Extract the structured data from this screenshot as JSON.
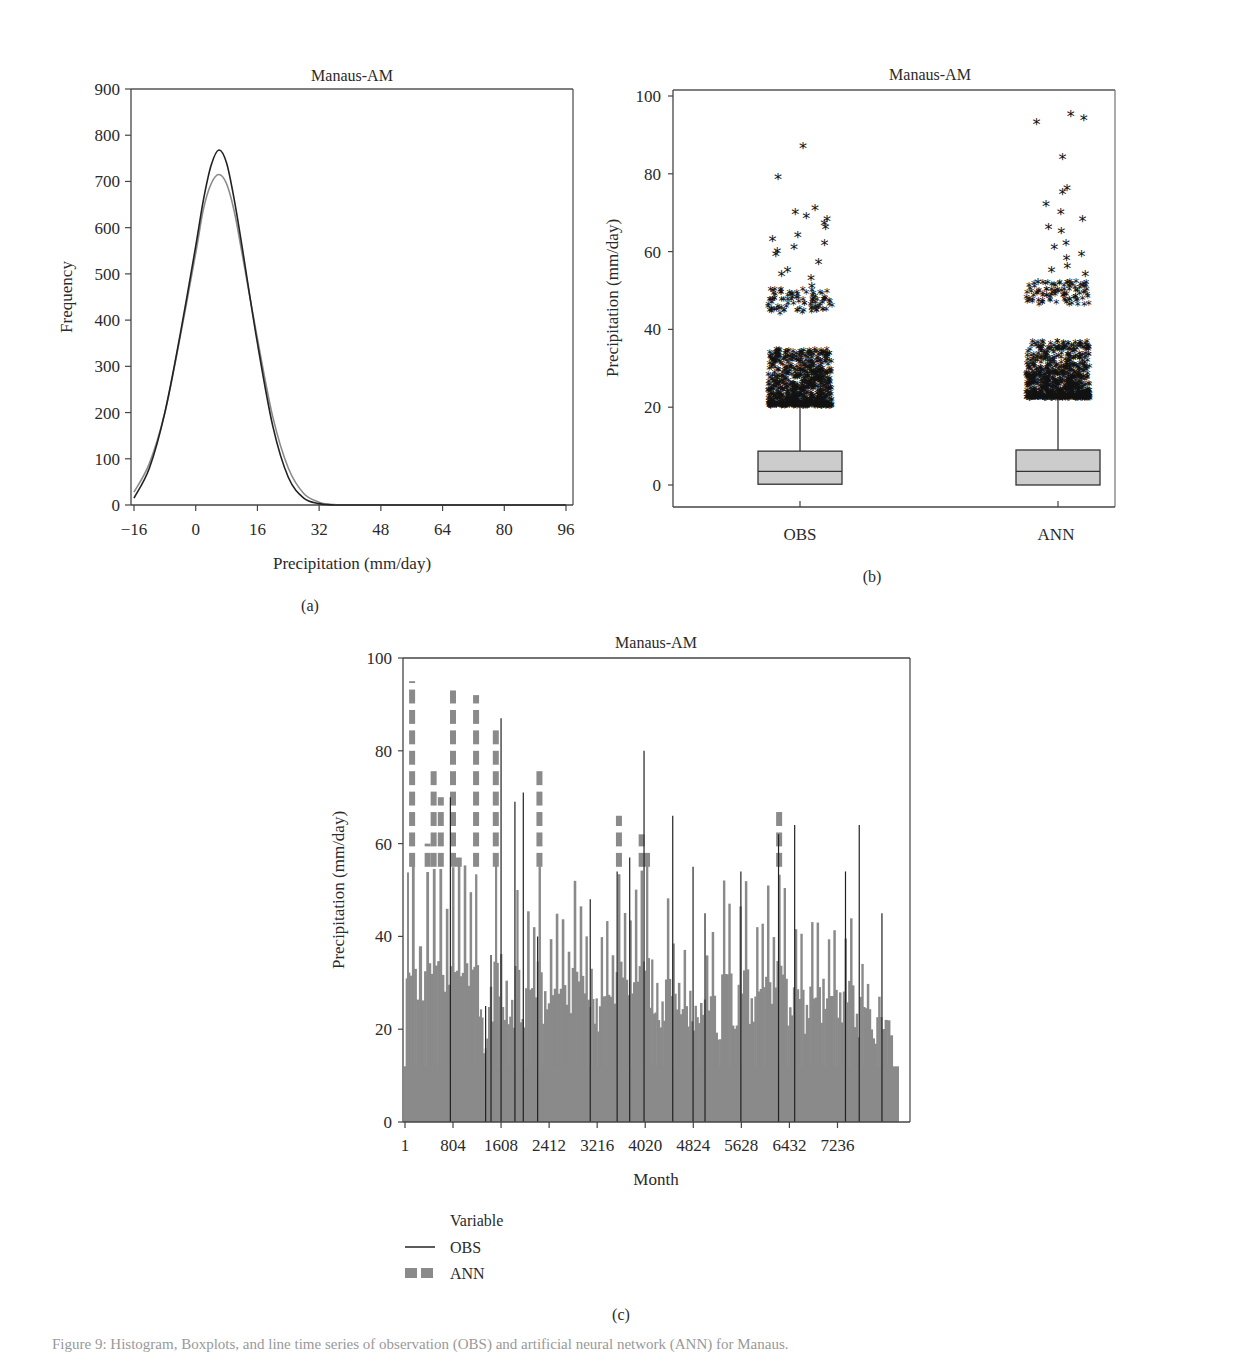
{
  "chart_data": [
    {
      "id": "a",
      "type": "line",
      "panel_label": "(a)",
      "title": "Manaus-AM",
      "xlabel": "Precipitation (mm/day)",
      "ylabel": "Frequency",
      "xlim": [
        -16,
        97
      ],
      "ylim": [
        0,
        900
      ],
      "xticks": [
        -16,
        0,
        16,
        32,
        48,
        64,
        80,
        96
      ],
      "xtick_labels": [
        "−16",
        "0",
        "16",
        "32",
        "48",
        "64",
        "80",
        "96"
      ],
      "yticks": [
        0,
        100,
        200,
        300,
        400,
        500,
        600,
        700,
        800,
        900
      ],
      "grid": false,
      "series": [
        {
          "name": "OBS",
          "color": "#222222",
          "x": [
            -16,
            -12,
            -8,
            -4,
            0,
            2,
            4,
            6,
            8,
            10,
            12,
            16,
            20,
            24,
            28,
            32,
            34,
            36,
            40,
            96
          ],
          "y": [
            15,
            80,
            200,
            370,
            560,
            660,
            735,
            768,
            740,
            660,
            560,
            350,
            170,
            60,
            15,
            3,
            1,
            0,
            0,
            0
          ]
        },
        {
          "name": "ANN",
          "color": "#8a8a8a",
          "x": [
            -16,
            -12,
            -8,
            -4,
            0,
            2,
            4,
            6,
            8,
            10,
            12,
            16,
            20,
            24,
            28,
            32,
            34,
            36,
            40,
            96
          ],
          "y": [
            28,
            90,
            200,
            365,
            545,
            640,
            695,
            715,
            695,
            635,
            545,
            360,
            190,
            80,
            25,
            6,
            2,
            1,
            0,
            0
          ]
        }
      ]
    },
    {
      "id": "b",
      "type": "box",
      "panel_label": "(b)",
      "title": "Manaus-AM",
      "xlabel": "",
      "ylabel": "Precipitation (mm/day)",
      "ylim": [
        -6,
        102
      ],
      "yticks": [
        0,
        20,
        40,
        60,
        80,
        100
      ],
      "categories": [
        "OBS",
        "ANN"
      ],
      "boxes": [
        {
          "name": "OBS",
          "q1": 0.2,
          "median": 3.5,
          "q3": 8.7,
          "whisker_low": 0,
          "whisker_high": 20,
          "outliers_range": [
            20,
            50
          ],
          "outliers_extreme": [
            87,
            79,
            71,
            70,
            69,
            68,
            67,
            66,
            64,
            63,
            62,
            61,
            60,
            59,
            57,
            55,
            54,
            53,
            51
          ]
        },
        {
          "name": "ANN",
          "q1": 0,
          "median": 3.5,
          "q3": 9,
          "whisker_low": 0,
          "whisker_high": 22,
          "outliers_range": [
            22,
            52
          ],
          "outliers_extreme": [
            95,
            94,
            93,
            84,
            76,
            75,
            72,
            70,
            68,
            66,
            65,
            62,
            61,
            59,
            58,
            56,
            55,
            54,
            52
          ]
        }
      ],
      "box_fill": "#cccccc",
      "grid": false
    },
    {
      "id": "c",
      "type": "bar",
      "panel_label": "(c)",
      "title": "Manaus-AM",
      "xlabel": "Month",
      "ylabel": "Precipitation (mm/day)",
      "xlim": [
        1,
        8441
      ],
      "ylim": [
        0,
        100
      ],
      "xticks": [
        1,
        804,
        1608,
        2412,
        3216,
        4020,
        4824,
        5628,
        6432,
        7236
      ],
      "yticks": [
        0,
        20,
        40,
        60,
        80,
        100
      ],
      "legend": {
        "title": "Variable",
        "position": "below-left",
        "entries": [
          {
            "name": "OBS",
            "style": "solid line",
            "color": "#222222"
          },
          {
            "name": "ANN",
            "style": "dashed thick",
            "color": "#8a8a8a"
          }
        ]
      },
      "grid": false,
      "series": [
        {
          "name": "ANN_peak_envelope",
          "color": "#8a8a8a",
          "x": [
            40,
            120,
            260,
            380,
            480,
            600,
            700,
            804,
            900,
            1000,
            1100,
            1190,
            1270,
            1340,
            1440,
            1520,
            1600,
            1700,
            1790,
            1880,
            1960,
            2060,
            2160,
            2250,
            2340,
            2440,
            2540,
            2640,
            2740,
            2840,
            2940,
            3040,
            3120,
            3200,
            3290,
            3380,
            3470,
            3580,
            3680,
            3770,
            3860,
            3960,
            4050,
            4130,
            4220,
            4300,
            4400,
            4490,
            4580,
            4680,
            4770,
            4860,
            4950,
            5050,
            5150,
            5240,
            5340,
            5420,
            5520,
            5610,
            5700,
            5800,
            5890,
            5980,
            6070,
            6170,
            6260,
            6350,
            6440,
            6540,
            6630,
            6720,
            6810,
            6900,
            7000,
            7090,
            7180,
            7280,
            7370,
            7460,
            7560,
            7650,
            7740,
            7840,
            7930,
            8030
          ],
          "y": [
            54,
            95,
            38,
            60,
            76,
            70,
            45,
            93,
            57,
            55,
            50,
            92,
            25,
            15,
            30,
            85,
            35,
            30,
            25,
            52,
            22,
            44,
            40,
            77,
            30,
            40,
            45,
            45,
            35,
            50,
            47,
            40,
            34,
            25,
            38,
            42,
            36,
            66,
            46,
            42,
            52,
            62,
            59,
            34,
            30,
            26,
            49,
            40,
            30,
            36,
            28,
            25,
            27,
            35,
            42,
            17,
            52,
            49,
            22,
            46,
            50,
            28,
            40,
            44,
            49,
            40,
            67,
            49,
            26,
            43,
            40,
            25,
            42,
            42,
            30,
            40,
            43,
            26,
            38,
            44,
            22,
            36,
            29,
            20,
            29,
            23
          ]
        },
        {
          "name": "OBS_spikes",
          "color": "#222222",
          "x": [
            760,
            1350,
            1440,
            1608,
            1840,
            1980,
            2220,
            3100,
            3550,
            3760,
            4000,
            4480,
            4820,
            5020,
            5620,
            6250,
            6520,
            7370,
            7600,
            7980
          ],
          "y": [
            70,
            25,
            36,
            87,
            69,
            71,
            40,
            48,
            54,
            57,
            80,
            66,
            55,
            45,
            54,
            62,
            64,
            54,
            64,
            45
          ]
        }
      ]
    }
  ],
  "panels": {
    "a": {
      "title": "Manaus-AM",
      "xlabel": "Precipitation (mm/day)",
      "ylabel": "Frequency",
      "label": "(a)"
    },
    "b": {
      "title": "Manaus-AM",
      "ylabel": "Precipitation (mm/day)",
      "label": "(b)",
      "cat_obs": "OBS",
      "cat_ann": "ANN"
    },
    "c": {
      "title": "Manaus-AM",
      "xlabel": "Month",
      "ylabel": "Precipitation (mm/day)",
      "label": "(c)",
      "legend_title": "Variable",
      "legend_obs": "OBS",
      "legend_ann": "ANN"
    }
  },
  "caption": "Figure 9: Histogram, Boxplots, and line time series of observation (OBS) and artificial neural network (ANN) for Manaus."
}
